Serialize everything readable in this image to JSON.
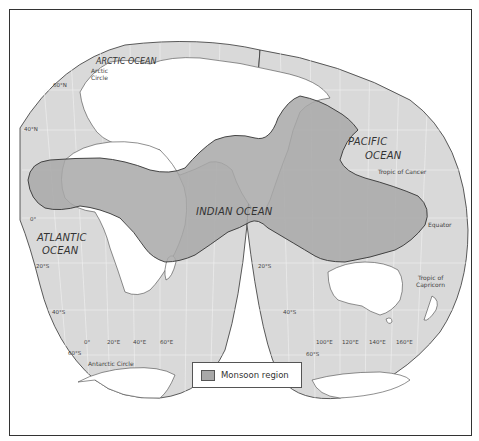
{
  "map": {
    "projection": "interrupted world map (Eastern Hemisphere focus)",
    "colors": {
      "ocean": "#d9d9d9",
      "land": "#ffffff",
      "monsoon": "#a8a8a8",
      "border": "#333333",
      "frame": "#333333"
    },
    "oceans": [
      {
        "id": "arctic",
        "label": "ARCTIC OCEAN"
      },
      {
        "id": "atlantic",
        "line1": "ATLANTIC",
        "line2": "OCEAN"
      },
      {
        "id": "indian",
        "label": "INDIAN  OCEAN"
      },
      {
        "id": "pacific",
        "line1": "PACIFIC",
        "line2": "OCEAN"
      }
    ],
    "lines": {
      "arctic_circle": {
        "line1": "Arctic",
        "line2": "Circle"
      },
      "antarctic_circle": "Antarctic Circle",
      "tropic_cancer": "Tropic of Cancer",
      "equator": "Equator",
      "tropic_capricorn": {
        "line1": "Tropic of",
        "line2": "Capricorn"
      }
    },
    "latitudes_left": [
      "60°N",
      "40°N",
      "0°",
      "20°S",
      "40°S",
      "60°S"
    ],
    "latitudes_right": [
      "20°S",
      "40°S",
      "60°S"
    ],
    "longitudes_left": [
      "0°",
      "20°E",
      "40°E",
      "60°E"
    ],
    "longitudes_right": [
      "100°E",
      "120°E",
      "140°E",
      "160°E"
    ]
  },
  "legend": {
    "items": [
      {
        "label": "Monsoon region",
        "color": "#a8a8a8"
      }
    ]
  }
}
